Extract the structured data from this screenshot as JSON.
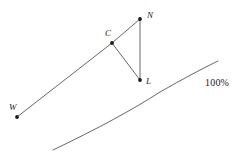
{
  "figure": {
    "title": "",
    "width": 251,
    "height": 162,
    "background_color": "#ffffff",
    "stroke_color": "#555555",
    "point_color": "#1a1a1a",
    "label_color": "#1a1a1a"
  },
  "points": [
    {
      "id": "W",
      "label": "W",
      "x": 17,
      "y": 117,
      "label_x": 9,
      "label_y": 110
    },
    {
      "id": "C",
      "label": "C",
      "x": 112,
      "y": 43,
      "label_x": 105,
      "label_y": 36
    },
    {
      "id": "N",
      "label": "N",
      "x": 140,
      "y": 19,
      "label_x": 147,
      "label_y": 18
    },
    {
      "id": "L",
      "label": "L",
      "x": 140,
      "y": 80,
      "label_x": 146,
      "label_y": 84
    }
  ],
  "segments": [
    {
      "id": "W-C",
      "from": "W",
      "to": "C"
    },
    {
      "id": "C-N",
      "from": "C",
      "to": "N"
    },
    {
      "id": "C-L",
      "from": "C",
      "to": "L"
    },
    {
      "id": "N-L",
      "from": "N",
      "to": "L"
    }
  ],
  "curve": {
    "id": "frontier-curve",
    "label": "100%",
    "label_x": 205,
    "label_y": 86,
    "path": "M 53 150 Q 120 118 160 92 Q 195 72 218 61"
  }
}
